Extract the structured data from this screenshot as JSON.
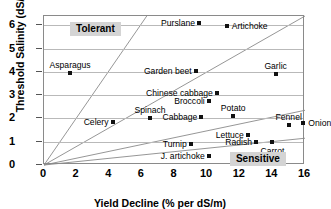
{
  "chart_data": {
    "type": "scatter",
    "title": "",
    "xlabel": "Yield Decline (% per dS/m)",
    "ylabel": "Threshold Salinity (dS/m)",
    "xlim": [
      0,
      16
    ],
    "ylim": [
      0,
      6.4
    ],
    "xticks": [
      0,
      2,
      4,
      6,
      8,
      10,
      12,
      14,
      16
    ],
    "yticks": [
      0,
      1,
      2,
      3,
      4,
      5,
      6
    ],
    "grid": "horizontal",
    "legend": "none",
    "annotations": [
      {
        "text": "Tolerant",
        "x": 1.6,
        "y": 5.85
      },
      {
        "text": "Sensitive",
        "x": 11.4,
        "y": 0.25
      }
    ],
    "reference_lines": [
      {
        "from": [
          0,
          0
        ],
        "to": [
          6.3,
          6.4
        ]
      },
      {
        "from": [
          0,
          0
        ],
        "to": [
          16,
          6.4
        ]
      },
      {
        "from": [
          0,
          0
        ],
        "to": [
          16,
          2.35
        ]
      },
      {
        "from": [
          0,
          0
        ],
        "to": [
          16,
          1.15
        ]
      }
    ],
    "points": [
      {
        "label": "Asparagus",
        "x": 1.6,
        "y": 3.95,
        "label_pos": "above"
      },
      {
        "label": "Purslane",
        "x": 9.5,
        "y": 6.1,
        "label_pos": "left"
      },
      {
        "label": "Artichoke",
        "x": 11.2,
        "y": 5.95,
        "label_pos": "right"
      },
      {
        "label": "Garden beet",
        "x": 9.3,
        "y": 4.05,
        "label_pos": "left"
      },
      {
        "label": "Garlic",
        "x": 14.2,
        "y": 3.9,
        "label_pos": "above"
      },
      {
        "label": "Chinese cabbage",
        "x": 10.6,
        "y": 3.1,
        "label_pos": "left"
      },
      {
        "label": "Broccoli",
        "x": 10.1,
        "y": 2.75,
        "label_pos": "left"
      },
      {
        "label": "Spinach",
        "x": 6.5,
        "y": 2.0,
        "label_pos": "above"
      },
      {
        "label": "Celery",
        "x": 4.2,
        "y": 1.85,
        "label_pos": "left"
      },
      {
        "label": "Cabbage",
        "x": 9.65,
        "y": 2.05,
        "label_pos": "left"
      },
      {
        "label": "Potato",
        "x": 11.6,
        "y": 2.1,
        "label_pos": "above"
      },
      {
        "label": "Fennel",
        "x": 15.0,
        "y": 1.7,
        "label_pos": "above"
      },
      {
        "label": "Lettuce",
        "x": 12.5,
        "y": 1.3,
        "label_pos": "left"
      },
      {
        "label": "Radish",
        "x": 13.0,
        "y": 1.0,
        "label_pos": "left"
      },
      {
        "label": "Onion",
        "x": 15.9,
        "y": 1.8,
        "label_pos": "right"
      },
      {
        "label": "Carrot",
        "x": 14.0,
        "y": 1.0,
        "label_pos": "below"
      },
      {
        "label": "Turnip",
        "x": 9.0,
        "y": 0.9,
        "label_pos": "left"
      },
      {
        "label": "J. artichoke",
        "x": 10.1,
        "y": 0.4,
        "label_pos": "left"
      }
    ]
  },
  "axes": {
    "y_title": "Threshold Salinity (dS/m)",
    "x_title": "Yield Decline (% per dS/m)",
    "x_tick_labels": [
      "0",
      "2",
      "4",
      "6",
      "8",
      "10",
      "12",
      "14",
      "16"
    ],
    "y_tick_labels": [
      "0",
      "1",
      "2",
      "3",
      "4",
      "5",
      "6"
    ]
  },
  "zones": {
    "tolerant": "Tolerant",
    "sensitive": "Sensitive"
  },
  "colors": {
    "point": "#111111",
    "grid": "#b9b9b9",
    "frame": "#8a8a8a",
    "zone_bg": "#d4d4d4",
    "text": "#000000"
  }
}
